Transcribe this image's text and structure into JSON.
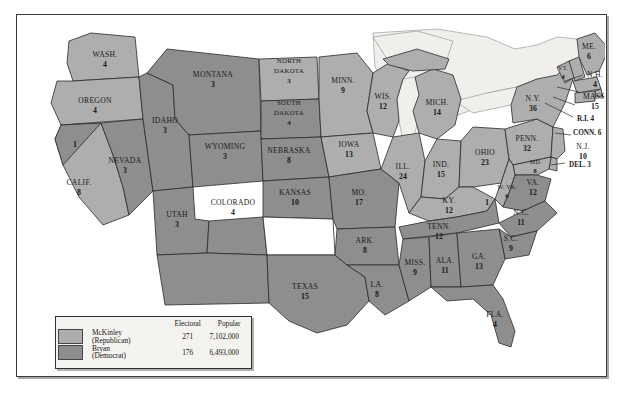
{
  "map": {
    "colors": {
      "republican": "#aeaeae",
      "democrat": "#8e8e8e",
      "water": "#f0efec",
      "border": "#2b2b2b",
      "background": "#ffffff",
      "frame": "#3a3a3a"
    },
    "split_electors": [
      {
        "id": "california-split-elector",
        "label": "1"
      },
      {
        "id": "kentucky-split-elector",
        "label": "1"
      }
    ],
    "states": [
      {
        "id": "washington",
        "name": "WASH.",
        "votes": "4",
        "party": "republican"
      },
      {
        "id": "oregon",
        "name": "OREGON",
        "votes": "4",
        "party": "republican"
      },
      {
        "id": "california",
        "name": "CALIF.",
        "votes": "8",
        "party": "republican"
      },
      {
        "id": "nevada",
        "name": "NEVADA",
        "votes": "3",
        "party": "democrat"
      },
      {
        "id": "idaho",
        "name": "IDAHO",
        "votes": "3",
        "party": "democrat"
      },
      {
        "id": "montana",
        "name": "MONTANA",
        "votes": "3",
        "party": "democrat"
      },
      {
        "id": "wyoming",
        "name": "WYOMING",
        "votes": "3",
        "party": "democrat"
      },
      {
        "id": "utah",
        "name": "UTAH",
        "votes": "3",
        "party": "democrat"
      },
      {
        "id": "colorado",
        "name": "COLORADO",
        "votes": "4",
        "party": "democrat"
      },
      {
        "id": "north-dakota",
        "name": "NORTH DAKOTA",
        "votes": "3",
        "party": "republican"
      },
      {
        "id": "south-dakota",
        "name": "SOUTH DAKOTA",
        "votes": "4",
        "party": "democrat"
      },
      {
        "id": "nebraska",
        "name": "NEBRASKA",
        "votes": "8",
        "party": "democrat"
      },
      {
        "id": "kansas",
        "name": "KANSAS",
        "votes": "10",
        "party": "democrat"
      },
      {
        "id": "texas",
        "name": "TEXAS",
        "votes": "15",
        "party": "democrat"
      },
      {
        "id": "minnesota",
        "name": "MINN.",
        "votes": "9",
        "party": "republican"
      },
      {
        "id": "iowa",
        "name": "IOWA",
        "votes": "13",
        "party": "republican"
      },
      {
        "id": "missouri",
        "name": "MO.",
        "votes": "17",
        "party": "democrat"
      },
      {
        "id": "arkansas",
        "name": "ARK.",
        "votes": "8",
        "party": "democrat"
      },
      {
        "id": "louisiana",
        "name": "LA.",
        "votes": "8",
        "party": "democrat"
      },
      {
        "id": "wisconsin",
        "name": "WIS.",
        "votes": "12",
        "party": "republican"
      },
      {
        "id": "illinois",
        "name": "ILL.",
        "votes": "24",
        "party": "republican"
      },
      {
        "id": "michigan",
        "name": "MICH.",
        "votes": "14",
        "party": "republican"
      },
      {
        "id": "indiana",
        "name": "IND.",
        "votes": "15",
        "party": "republican"
      },
      {
        "id": "ohio",
        "name": "OHIO",
        "votes": "23",
        "party": "republican"
      },
      {
        "id": "kentucky",
        "name": "KY.",
        "votes": "12",
        "party": "republican"
      },
      {
        "id": "tennessee",
        "name": "TENN.",
        "votes": "12",
        "party": "democrat"
      },
      {
        "id": "mississippi",
        "name": "MISS.",
        "votes": "9",
        "party": "democrat"
      },
      {
        "id": "alabama",
        "name": "ALA.",
        "votes": "11",
        "party": "democrat"
      },
      {
        "id": "georgia",
        "name": "GA.",
        "votes": "13",
        "party": "democrat"
      },
      {
        "id": "florida",
        "name": "FLA.",
        "votes": "4",
        "party": "democrat"
      },
      {
        "id": "south-carolina",
        "name": "S.C.",
        "votes": "9",
        "party": "democrat"
      },
      {
        "id": "north-carolina",
        "name": "N.C.",
        "votes": "11",
        "party": "democrat"
      },
      {
        "id": "virginia",
        "name": "VA.",
        "votes": "12",
        "party": "democrat"
      },
      {
        "id": "west-virginia",
        "name": "W. VA.",
        "votes": "6",
        "party": "republican"
      },
      {
        "id": "pennsylvania",
        "name": "PENN.",
        "votes": "32",
        "party": "republican"
      },
      {
        "id": "maryland",
        "name": "MD",
        "votes": "8",
        "party": "republican"
      },
      {
        "id": "new-york",
        "name": "N.Y.",
        "votes": "36",
        "party": "republican"
      },
      {
        "id": "vermont",
        "name": "VT.",
        "votes": "4",
        "party": "republican"
      },
      {
        "id": "maine",
        "name": "ME.",
        "votes": "6",
        "party": "republican"
      }
    ],
    "callouts": [
      {
        "id": "new-hampshire",
        "name": "N.H.",
        "votes": "4",
        "party": "republican"
      },
      {
        "id": "massachusetts",
        "name": "MASS.",
        "votes": "15",
        "party": "republican"
      },
      {
        "id": "rhode-island",
        "name": "R.I. 4",
        "votes": "",
        "party": "republican"
      },
      {
        "id": "connecticut",
        "name": "CONN. 6",
        "votes": "",
        "party": "republican"
      },
      {
        "id": "new-jersey",
        "name": "N.J.",
        "votes": "10",
        "party": "republican"
      },
      {
        "id": "delaware",
        "name": "DEL. 3",
        "votes": "",
        "party": "republican"
      }
    ]
  },
  "legend": {
    "headers": {
      "swatch": "",
      "candidate": "",
      "electoral": "Electoral",
      "popular": "Popular"
    },
    "rows": [
      {
        "id": "mckinley",
        "name": "McKinley",
        "party": "(Republican)",
        "electoral": "271",
        "popular": "7,102,000",
        "color": "#aeaeae"
      },
      {
        "id": "bryan",
        "name": "Bryan",
        "party": "(Democrat)",
        "electoral": "176",
        "popular": "6,493,000",
        "color": "#8e8e8e"
      }
    ]
  }
}
